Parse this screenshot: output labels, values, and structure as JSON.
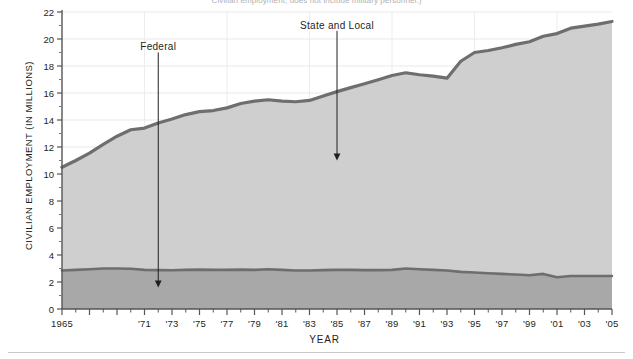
{
  "caption": {
    "text": "Civilian employment; does not include military personnel.)"
  },
  "chart_data": {
    "type": "area",
    "title": "",
    "subtitle": "",
    "xlabel": "YEAR",
    "ylabel": "CIVILIAN EMPLOYMENT (IN MILLIONS)",
    "stacked": true,
    "grid": true,
    "legend_position": "annotations-on-plot",
    "xlim": [
      1965,
      2005
    ],
    "ylim": [
      0,
      22
    ],
    "y_ticks": [
      0,
      2,
      4,
      6,
      8,
      10,
      12,
      14,
      16,
      18,
      20,
      22
    ],
    "y_tick_labels": [
      "0",
      "2",
      "4",
      "6",
      "8",
      "10",
      "12",
      "14",
      "16",
      "18",
      "20",
      "22"
    ],
    "x_ticks": [
      1965,
      1967,
      1969,
      1971,
      1973,
      1975,
      1977,
      1979,
      1981,
      1983,
      1985,
      1987,
      1989,
      1991,
      1993,
      1995,
      1997,
      1999,
      2001,
      2003,
      2005
    ],
    "x_tick_labels": [
      "1965",
      "",
      "",
      "'71",
      "'73",
      "'75",
      "'77",
      "'79",
      "'81",
      "'83",
      "'85",
      "'87",
      "'89",
      "'91",
      "'93",
      "'95",
      "'97",
      "'99",
      "'01",
      "'03",
      "'05"
    ],
    "x_minor_step": 1,
    "x": [
      1965,
      1966,
      1967,
      1968,
      1969,
      1970,
      1971,
      1972,
      1973,
      1974,
      1975,
      1976,
      1977,
      1978,
      1979,
      1980,
      1981,
      1982,
      1983,
      1984,
      1985,
      1986,
      1987,
      1988,
      1989,
      1990,
      1991,
      1992,
      1993,
      1994,
      1995,
      1996,
      1997,
      1998,
      1999,
      2000,
      2001,
      2002,
      2003,
      2004,
      2005
    ],
    "series": [
      {
        "name": "Federal",
        "color": "#a8a8a8",
        "line_color": "#6e6e6e",
        "values": [
          2.85,
          2.9,
          2.95,
          3.0,
          3.0,
          2.98,
          2.9,
          2.88,
          2.87,
          2.9,
          2.92,
          2.9,
          2.9,
          2.92,
          2.9,
          2.95,
          2.9,
          2.85,
          2.85,
          2.88,
          2.9,
          2.9,
          2.88,
          2.88,
          2.9,
          3.0,
          2.95,
          2.9,
          2.85,
          2.75,
          2.7,
          2.65,
          2.6,
          2.55,
          2.5,
          2.6,
          2.35,
          2.45,
          2.45,
          2.45,
          2.45
        ]
      },
      {
        "name": "State and Local",
        "color": "#cfcfcf",
        "line_color": "#6e6e6e",
        "values": [
          7.65,
          8.1,
          8.6,
          9.2,
          9.8,
          10.3,
          10.5,
          10.9,
          11.2,
          11.5,
          11.7,
          11.8,
          12.0,
          12.3,
          12.5,
          12.55,
          12.5,
          12.5,
          12.6,
          12.9,
          13.2,
          13.5,
          13.8,
          14.1,
          14.4,
          14.5,
          14.4,
          14.35,
          14.25,
          15.6,
          16.3,
          16.5,
          16.75,
          17.05,
          17.3,
          17.6,
          18.05,
          18.35,
          18.5,
          18.65,
          18.85
        ]
      }
    ],
    "totals": [
      10.5,
      11.0,
      11.55,
      12.2,
      12.8,
      13.28,
      13.4,
      13.78,
      14.07,
      14.4,
      14.62,
      14.7,
      14.9,
      15.22,
      15.4,
      15.5,
      15.4,
      15.35,
      15.45,
      15.78,
      16.1,
      16.4,
      16.68,
      16.98,
      17.3,
      17.5,
      17.35,
      17.25,
      17.1,
      18.35,
      19.0,
      19.15,
      19.35,
      19.6,
      19.8,
      20.2,
      20.4,
      20.8,
      20.95,
      21.1,
      21.3
    ],
    "annotations": [
      {
        "label": "Federal",
        "x": 1972,
        "label_y": 19.3,
        "arrow_to_y": 1.6
      },
      {
        "label": "State and Local",
        "x": 1985,
        "label_y": 20.9,
        "arrow_to_y": 11.0
      }
    ]
  }
}
